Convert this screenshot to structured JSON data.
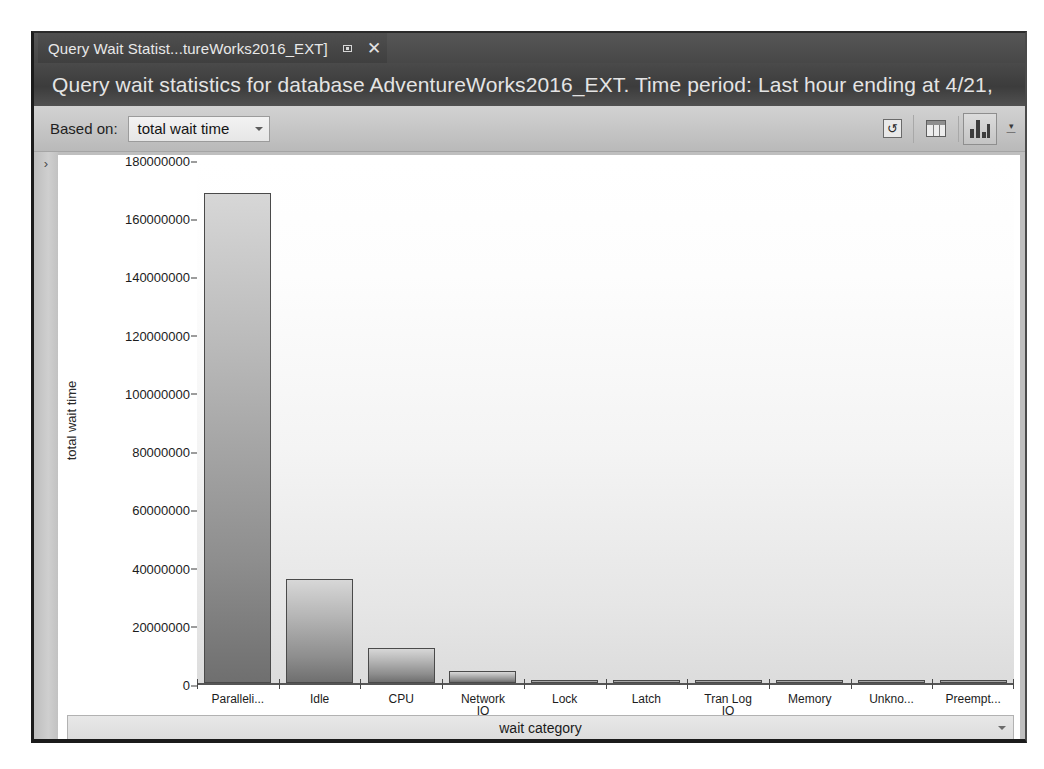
{
  "window": {
    "tab": {
      "label": "Query Wait Statist...tureWorks2016_EXT]",
      "pin_icon": "pin-icon",
      "close_icon": "close-icon"
    },
    "header_title": "Query wait statistics for database AdventureWorks2016_EXT. Time period: Last hour ending at 4/21,"
  },
  "toolbar": {
    "based_on_label": "Based on:",
    "based_on_value": "total wait time",
    "buttons": [
      {
        "name": "refresh-button",
        "icon": "refresh-icon",
        "selected": false,
        "glyph": "↻"
      },
      {
        "name": "grid-view-button",
        "icon": "grid-icon",
        "selected": false
      },
      {
        "name": "chart-view-button",
        "icon": "bar-chart-icon",
        "selected": true
      }
    ],
    "overflow_label": "▾"
  },
  "rail": {
    "expand_icon": "chevron-right-icon",
    "expand_glyph": "›"
  },
  "chart_data": {
    "type": "bar",
    "title": "",
    "xlabel": "wait category",
    "ylabel": "total wait time",
    "ylim": [
      0,
      180000000
    ],
    "grid": false,
    "legend": "none",
    "ytick_labels": [
      "180000000",
      "160000000",
      "140000000",
      "120000000",
      "100000000",
      "80000000",
      "60000000",
      "40000000",
      "20000000",
      "0"
    ],
    "ytick_values": [
      180000000,
      160000000,
      140000000,
      120000000,
      100000000,
      80000000,
      60000000,
      40000000,
      20000000,
      0
    ],
    "categories": [
      "Paralleli...",
      "Idle",
      "CPU",
      "Network IO",
      "Lock",
      "Latch",
      "Tran Log IO",
      "Memory",
      "Unkno...",
      "Preempt..."
    ],
    "category_lines": [
      [
        "Paralleli...",
        ""
      ],
      [
        "Idle",
        ""
      ],
      [
        "CPU",
        ""
      ],
      [
        "Network",
        "IO"
      ],
      [
        "Lock",
        ""
      ],
      [
        "Latch",
        ""
      ],
      [
        "Tran Log",
        "IO"
      ],
      [
        "Memory",
        ""
      ],
      [
        "Unkno...",
        ""
      ],
      [
        "Preempt...",
        ""
      ]
    ],
    "values": [
      169000000,
      36000000,
      12000000,
      4000000,
      900000,
      800000,
      500000,
      400000,
      300000,
      300000
    ]
  },
  "xaxis_selector": {
    "label": "wait category",
    "chevron_icon": "chevron-down-icon"
  }
}
